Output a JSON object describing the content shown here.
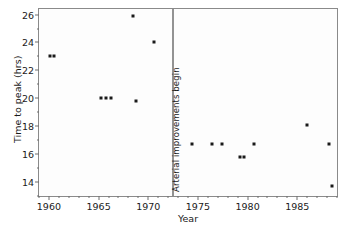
{
  "chart_data": {
    "type": "scatter",
    "title": "",
    "xlabel": "Year",
    "ylabel": "Time to peak (hrs)",
    "xlim": [
      1959,
      1989
    ],
    "ylim": [
      13,
      26.4
    ],
    "grid": false,
    "legend": null,
    "x_ticks": [
      1960,
      1965,
      1970,
      1975,
      1980,
      1985
    ],
    "x_tick_labels": [
      "1960",
      "1965",
      "1970",
      "1975",
      "1980",
      "1985"
    ],
    "x_minor_tick_step": 1,
    "y_ticks": [
      14,
      16,
      18,
      20,
      22,
      24,
      26
    ],
    "y_tick_labels": [
      "14",
      "16",
      "18",
      "20",
      "22",
      "24",
      "26"
    ],
    "y_minor_ticks": [
      13,
      15,
      17,
      19,
      21,
      23,
      25
    ],
    "marker_color": "#1a1a1a",
    "points": [
      {
        "x": 1960.1,
        "y": 23.0
      },
      {
        "x": 1960.5,
        "y": 23.0
      },
      {
        "x": 1965.2,
        "y": 20.0
      },
      {
        "x": 1965.7,
        "y": 20.0
      },
      {
        "x": 1966.2,
        "y": 20.0
      },
      {
        "x": 1968.5,
        "y": 25.9
      },
      {
        "x": 1968.8,
        "y": 19.8
      },
      {
        "x": 1970.6,
        "y": 24.0
      },
      {
        "x": 1974.4,
        "y": 16.7
      },
      {
        "x": 1976.4,
        "y": 16.7
      },
      {
        "x": 1977.4,
        "y": 16.7
      },
      {
        "x": 1979.2,
        "y": 15.8
      },
      {
        "x": 1979.6,
        "y": 15.8
      },
      {
        "x": 1980.6,
        "y": 16.7
      },
      {
        "x": 1986.0,
        "y": 18.1
      },
      {
        "x": 1988.2,
        "y": 16.7
      },
      {
        "x": 1988.5,
        "y": 13.7
      }
    ],
    "annotations": [
      {
        "type": "vline-with-label",
        "text": "Arterial improvements begin",
        "x": 1972.5,
        "orientation": "vertical",
        "color": "#2b2b2b"
      }
    ]
  }
}
